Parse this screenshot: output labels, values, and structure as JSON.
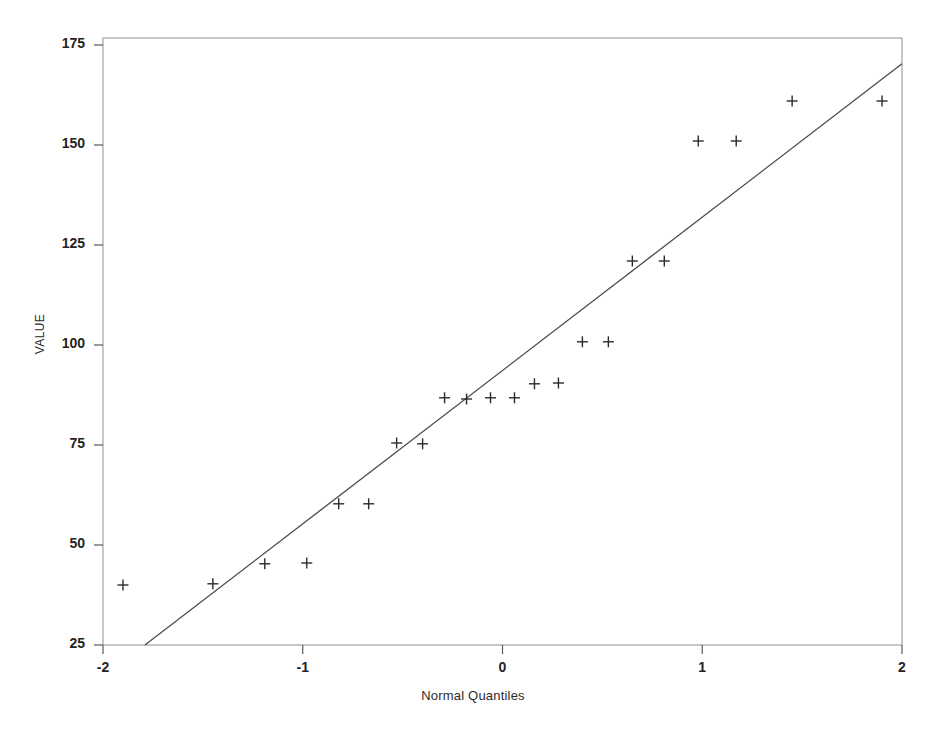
{
  "chart_data": {
    "type": "scatter",
    "title": "",
    "subtitle": "",
    "xlabel": "Normal Quantiles",
    "ylabel": "VALUE",
    "xlim": [
      -2,
      2
    ],
    "ylim": [
      25,
      175
    ],
    "xticks": [
      -2,
      -1,
      0,
      1,
      2
    ],
    "xtick_labels": [
      "-2",
      "-1",
      "0",
      "1",
      "2"
    ],
    "yticks": [
      25,
      50,
      75,
      100,
      125,
      150,
      175
    ],
    "ytick_labels": [
      "25",
      "50",
      "75",
      "100",
      "125",
      "150",
      "175"
    ],
    "grid": false,
    "legend": null,
    "marker": "plus",
    "marker_color": "#2b2b2b",
    "line_color": "#4a4a4a",
    "frame_color": "#9a9a9a",
    "background": "#ffffff",
    "series": [
      {
        "name": "Sample quantiles",
        "type": "scatter",
        "points": [
          {
            "x": -1.9,
            "y": 40.0
          },
          {
            "x": -1.45,
            "y": 40.3
          },
          {
            "x": -1.19,
            "y": 45.3
          },
          {
            "x": -0.98,
            "y": 45.5
          },
          {
            "x": -0.82,
            "y": 60.3
          },
          {
            "x": -0.67,
            "y": 60.3
          },
          {
            "x": -0.53,
            "y": 75.5
          },
          {
            "x": -0.4,
            "y": 75.3
          },
          {
            "x": -0.29,
            "y": 86.8
          },
          {
            "x": -0.18,
            "y": 86.5
          },
          {
            "x": -0.06,
            "y": 86.8
          },
          {
            "x": 0.06,
            "y": 86.8
          },
          {
            "x": 0.16,
            "y": 90.3
          },
          {
            "x": 0.28,
            "y": 90.5
          },
          {
            "x": 0.4,
            "y": 100.8
          },
          {
            "x": 0.53,
            "y": 100.8
          },
          {
            "x": 0.65,
            "y": 121.0
          },
          {
            "x": 0.81,
            "y": 121.0
          },
          {
            "x": 0.98,
            "y": 151.0
          },
          {
            "x": 1.17,
            "y": 151.0
          },
          {
            "x": 1.45,
            "y": 161.0
          },
          {
            "x": 1.9,
            "y": 161.0
          }
        ]
      },
      {
        "name": "Reference line",
        "type": "line",
        "points": [
          {
            "x": -1.79,
            "y": 25.0
          },
          {
            "x": 2.0,
            "y": 170.3
          }
        ]
      }
    ]
  }
}
